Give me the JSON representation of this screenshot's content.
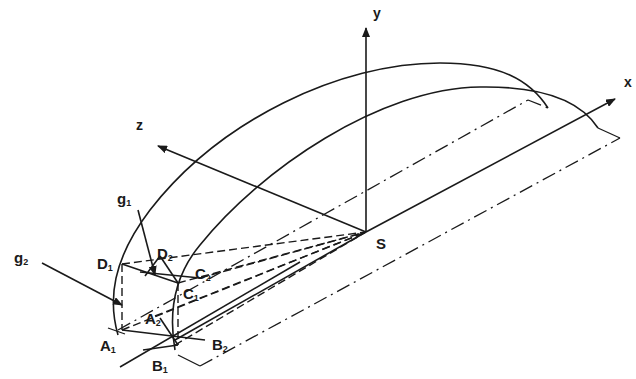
{
  "diagram": {
    "type": "3d-geometric-projection",
    "axes": {
      "x": {
        "label": "x"
      },
      "y": {
        "label": "y"
      },
      "z": {
        "label": "z"
      }
    },
    "origin": {
      "label": "S"
    },
    "points": {
      "D1": {
        "base": "D",
        "sub": "1"
      },
      "D2": {
        "base": "D",
        "sub": "2"
      },
      "C1": {
        "base": "C",
        "sub": "1"
      },
      "C2": {
        "base": "C",
        "sub": "2"
      },
      "A1": {
        "base": "A",
        "sub": "1"
      },
      "A2": {
        "base": "A",
        "sub": "2"
      },
      "B1": {
        "base": "B",
        "sub": "1"
      },
      "B2": {
        "base": "B",
        "sub": "2"
      }
    },
    "vectors": {
      "g1": {
        "base": "g",
        "sub": "1"
      },
      "g2": {
        "base": "g",
        "sub": "2"
      }
    },
    "line_color": "#1a1a1a"
  }
}
